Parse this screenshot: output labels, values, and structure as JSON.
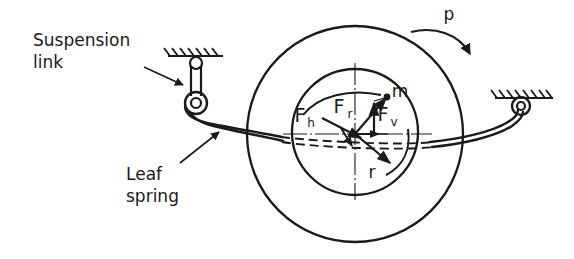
{
  "diagram": {
    "title_visible": false,
    "background_color": "#ffffff",
    "line_color": "#1a1a1a",
    "labels": {
      "suspension_link_line1": "Suspension",
      "suspension_link_line2": "link",
      "leaf_spring_line1": "Leaf",
      "leaf_spring_line2": "spring",
      "rotation": "p",
      "mass_point": "m",
      "radius": "r",
      "force_horizontal_base": "F",
      "force_horizontal_sub": "h",
      "force_resultant_base": "F",
      "force_resultant_sub": "r",
      "force_vertical_base": "F",
      "force_vertical_sub": "v"
    },
    "geometry": {
      "wheel_center_x": 355,
      "wheel_center_y": 134,
      "outer_radius": 108,
      "inner_radius": 63,
      "mass_point_x": 388,
      "mass_point_y": 96
    }
  }
}
